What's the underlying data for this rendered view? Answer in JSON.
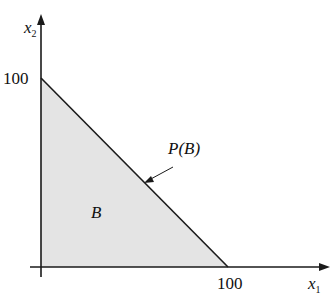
{
  "diagram": {
    "type": "feasible-region",
    "axes": {
      "x_label": "x",
      "x_sub": "1",
      "y_label": "x",
      "y_sub": "2",
      "x_tick": "100",
      "y_tick": "100"
    },
    "region_label": "B",
    "boundary_label": "P(B)",
    "vertices": [
      [
        0,
        0
      ],
      [
        100,
        0
      ],
      [
        0,
        100
      ]
    ],
    "colors": {
      "fill": "#e4e4e4",
      "stroke": "#1a1a1a"
    }
  }
}
